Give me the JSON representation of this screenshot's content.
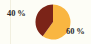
{
  "chart_data": {
    "type": "pie",
    "title": "",
    "categories": [
      "40 %",
      "60 %"
    ],
    "values": [
      40,
      60
    ],
    "labels": [
      "40 %",
      "60 %"
    ],
    "colors": [
      "#7b2418",
      "#f9b641"
    ],
    "legend": "none",
    "grid": false,
    "start_angle_deg": 0,
    "direction": "counterclockwise",
    "slices": [
      {
        "label": "40 %",
        "value": 40,
        "color": "#7b2418",
        "label_position": "outside-upper-left"
      },
      {
        "label": "60 %",
        "value": 60,
        "color": "#f9b641",
        "label_position": "outside-lower-right"
      }
    ]
  },
  "figure": {
    "background_color": "#fdfdf6",
    "rule_color": "#f1efdf",
    "text_color": "#2b2b2b"
  }
}
